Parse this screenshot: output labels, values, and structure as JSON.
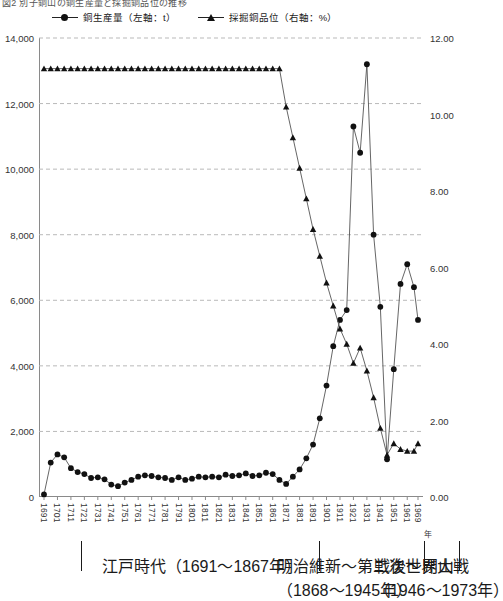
{
  "figure": {
    "title": "図2  別子銅山の銅生産量と採掘銅品位の推移",
    "x_unit": "年"
  },
  "legend": [
    {
      "marker": "circle-marker",
      "label": "銅生産量（左軸：t）"
    },
    {
      "marker": "triangle-marker",
      "label": "採掘銅品位（右軸：%）"
    }
  ],
  "periods": [
    {
      "name": "edo",
      "line1": "江戸時代（1691〜1867年）",
      "line2": "",
      "start": 1691,
      "end": 1867
    },
    {
      "name": "meiji-ww2",
      "line1": "明治維新〜第二次世界大戦",
      "line2": "（1868〜1945年）",
      "start": 1868,
      "end": 1945
    },
    {
      "name": "postwar-closure",
      "line1": "戦後〜閉山",
      "line2": "（1946〜1973年）",
      "start": 1946,
      "end": 1973
    }
  ],
  "chart_data": {
    "type": "line",
    "title": "図2  別子銅山の銅生産量と採掘銅品位の推移",
    "xlabel": "年",
    "ylabel": "銅生産量（t）",
    "y2label": "採掘銅品位（%）",
    "xlim": [
      1691,
      1969
    ],
    "ylim": [
      0,
      14000
    ],
    "y2lim": [
      0.0,
      12.0
    ],
    "yticks": [
      "0",
      "2,000",
      "4,000",
      "6,000",
      "8,000",
      "10,000",
      "12,000",
      "14,000"
    ],
    "ytick_values": [
      0,
      2000,
      4000,
      6000,
      8000,
      10000,
      12000,
      14000
    ],
    "y2ticks": [
      "0.00",
      "2.00",
      "4.00",
      "6.00",
      "8.00",
      "10.00",
      "12.00"
    ],
    "y2tick_values": [
      0,
      2,
      4,
      6,
      8,
      10,
      12
    ],
    "xticks": [
      "1691",
      "1701",
      "1711",
      "1721",
      "1731",
      "1741",
      "1751",
      "1761",
      "1771",
      "1781",
      "1791",
      "1801",
      "1811",
      "1821",
      "1831",
      "1841",
      "1851",
      "1861",
      "1871",
      "1881",
      "1891",
      "1901",
      "1911",
      "1921",
      "1931",
      "1941",
      "1951",
      "1961",
      "1969"
    ],
    "xtick_values": [
      1691,
      1701,
      1711,
      1721,
      1731,
      1741,
      1751,
      1761,
      1771,
      1781,
      1791,
      1801,
      1811,
      1821,
      1831,
      1841,
      1851,
      1861,
      1871,
      1881,
      1891,
      1901,
      1911,
      1921,
      1931,
      1941,
      1951,
      1961,
      1969
    ],
    "grid": "horizontal-dashed",
    "legend_position": "top",
    "series": [
      {
        "name": "銅生産量（左軸：t）",
        "axis": "left",
        "marker": "circle",
        "color": "#111111",
        "x": [
          1691,
          1696,
          1701,
          1706,
          1711,
          1716,
          1721,
          1726,
          1731,
          1736,
          1741,
          1746,
          1751,
          1756,
          1761,
          1766,
          1771,
          1776,
          1781,
          1786,
          1791,
          1796,
          1801,
          1806,
          1811,
          1816,
          1821,
          1826,
          1831,
          1836,
          1841,
          1846,
          1851,
          1856,
          1861,
          1866,
          1871,
          1876,
          1881,
          1886,
          1891,
          1896,
          1901,
          1906,
          1911,
          1916,
          1921,
          1926,
          1931,
          1936,
          1941,
          1946,
          1951,
          1956,
          1961,
          1966,
          1969
        ],
        "values": [
          80,
          1050,
          1300,
          1210,
          880,
          760,
          700,
          580,
          600,
          540,
          380,
          330,
          440,
          520,
          620,
          660,
          640,
          600,
          580,
          520,
          600,
          520,
          560,
          620,
          600,
          620,
          600,
          680,
          640,
          660,
          720,
          640,
          660,
          740,
          700,
          520,
          400,
          620,
          840,
          1180,
          1600,
          2400,
          3400,
          4600,
          5400,
          5700,
          11300,
          10500,
          13200,
          8000,
          5800,
          1150,
          3900,
          6500,
          7100,
          6400,
          5400
        ]
      },
      {
        "name": "採掘銅品位（右軸：%）",
        "axis": "right",
        "marker": "triangle",
        "color": "#111111",
        "x": [
          1691,
          1696,
          1701,
          1706,
          1711,
          1716,
          1721,
          1726,
          1731,
          1736,
          1741,
          1746,
          1751,
          1756,
          1761,
          1766,
          1771,
          1776,
          1781,
          1786,
          1791,
          1796,
          1801,
          1806,
          1811,
          1816,
          1821,
          1826,
          1831,
          1836,
          1841,
          1846,
          1851,
          1856,
          1861,
          1866,
          1871,
          1876,
          1881,
          1886,
          1891,
          1896,
          1901,
          1906,
          1911,
          1916,
          1921,
          1926,
          1931,
          1936,
          1941,
          1946,
          1951,
          1956,
          1961,
          1966,
          1969
        ],
        "values": [
          11.2,
          11.2,
          11.2,
          11.2,
          11.2,
          11.2,
          11.2,
          11.2,
          11.2,
          11.2,
          11.2,
          11.2,
          11.2,
          11.2,
          11.2,
          11.2,
          11.2,
          11.2,
          11.2,
          11.2,
          11.2,
          11.2,
          11.2,
          11.2,
          11.2,
          11.2,
          11.2,
          11.2,
          11.2,
          11.2,
          11.2,
          11.2,
          11.2,
          11.2,
          11.2,
          11.2,
          10.2,
          9.4,
          8.6,
          7.8,
          7.0,
          6.3,
          5.6,
          5.0,
          4.4,
          4.0,
          3.5,
          3.9,
          3.3,
          2.6,
          1.8,
          1.1,
          1.4,
          1.25,
          1.2,
          1.2,
          1.4
        ]
      }
    ]
  }
}
